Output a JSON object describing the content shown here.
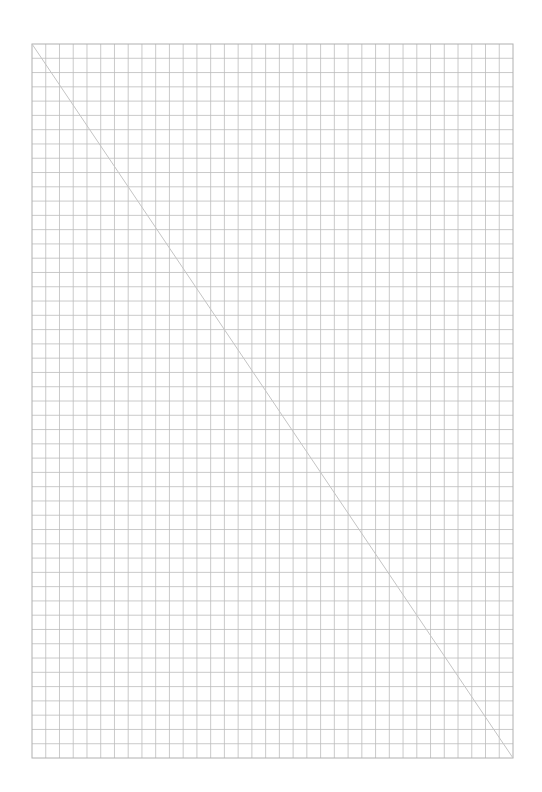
{
  "page": {
    "kind": "graph-paper",
    "background_color": "#ffffff",
    "width": 542,
    "height": 792
  },
  "grid": {
    "left": 32,
    "top": 44,
    "width": 481,
    "height": 714,
    "columns": 35,
    "rows": 50,
    "line_color": "#bdbdbd",
    "border_color": "#b0b0b0",
    "line_width": 0.8
  },
  "diagonal": {
    "from": "top-left",
    "to": "bottom-right",
    "x1": 32,
    "y1": 44,
    "x2": 513,
    "y2": 758,
    "color": "#c4c4c4",
    "line_width": 1
  },
  "labels": {
    "description": "Blank graph paper with a single diagonal line"
  }
}
